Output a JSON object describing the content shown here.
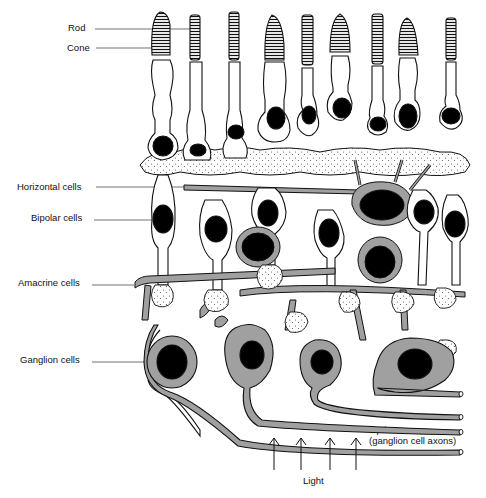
{
  "diagram": {
    "type": "retina-cross-section",
    "colors": {
      "outline": "#111111",
      "nucleus": "#000000",
      "fill_gray": "#a0a0a0",
      "background": "#ffffff"
    },
    "labels": {
      "rod": "Rod",
      "cone": "Cone",
      "horizontal": "Horizontal cells",
      "bipolar": "Bipolar cells",
      "amacrine": "Amacrine cells",
      "ganglion": "Ganglion cells",
      "optic_nerve_1": "Optic nerve",
      "optic_nerve_2": "(ganglion cell axons)",
      "light": "Light"
    },
    "photoreceptors": [
      {
        "x": 163,
        "kind": "cone"
      },
      {
        "x": 196,
        "kind": "rod"
      },
      {
        "x": 235,
        "kind": "rod"
      },
      {
        "x": 275,
        "kind": "cone"
      },
      {
        "x": 308,
        "kind": "rod"
      },
      {
        "x": 341,
        "kind": "cone"
      },
      {
        "x": 378,
        "kind": "rod"
      },
      {
        "x": 408,
        "kind": "cone"
      },
      {
        "x": 451,
        "kind": "rod"
      }
    ],
    "light_arrows": 4
  }
}
